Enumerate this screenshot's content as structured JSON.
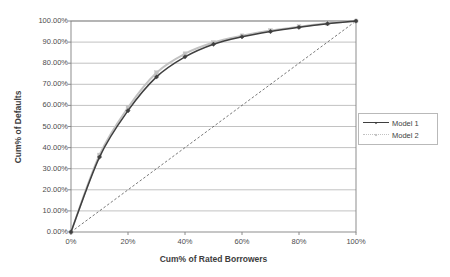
{
  "chart_data": {
    "type": "line",
    "title": "",
    "xlabel": "Cum% of Rated Borrowers",
    "ylabel": "Cum% of Defaults",
    "xlim": [
      0,
      100
    ],
    "ylim": [
      0,
      100
    ],
    "grid": "horizontal",
    "legend_position": "right",
    "x_tick_labels": [
      "0%",
      "20%",
      "40%",
      "60%",
      "80%",
      "100%"
    ],
    "x_tick_values": [
      0,
      20,
      40,
      60,
      80,
      100
    ],
    "y_tick_labels": [
      "0.00%",
      "10.00%",
      "20.00%",
      "30.00%",
      "40.00%",
      "50.00%",
      "60.00%",
      "70.00%",
      "80.00%",
      "90.00%",
      "100.00%"
    ],
    "y_tick_values": [
      0,
      10,
      20,
      30,
      40,
      50,
      60,
      70,
      80,
      90,
      100
    ],
    "x": [
      0,
      10,
      20,
      30,
      40,
      50,
      60,
      70,
      80,
      90,
      100
    ],
    "series": [
      {
        "name": "Model 1",
        "color": "#3f3f3f",
        "marker": "diamond",
        "values": [
          0,
          35.5,
          57.5,
          73.5,
          83.0,
          89.0,
          92.5,
          95.0,
          97.0,
          98.7,
          100
        ]
      },
      {
        "name": "Model 2",
        "color": "#c2c2c2",
        "marker": "square",
        "values": [
          0,
          36.5,
          59.0,
          75.5,
          84.5,
          89.8,
          93.0,
          95.5,
          97.3,
          98.9,
          100
        ]
      }
    ],
    "reference_line": {
      "name": "random-diagonal",
      "style": "dashed",
      "color": "#555555",
      "x": [
        0,
        100
      ],
      "values": [
        0,
        100
      ]
    }
  },
  "legend": {
    "items": [
      {
        "label": "Model 1"
      },
      {
        "label": "Model 2"
      }
    ]
  },
  "colors": {
    "model1": "#3f3f3f",
    "model2": "#c2c2c2",
    "grid": "#a8a8a8",
    "axis": "#808080",
    "text": "#4d4d4d"
  }
}
